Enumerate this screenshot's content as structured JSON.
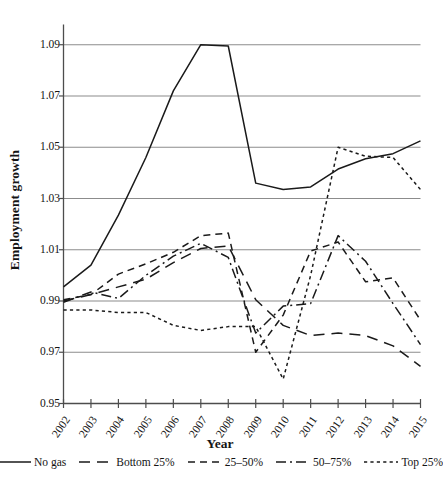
{
  "chart_data": {
    "type": "line",
    "title": "",
    "xlabel": "Year",
    "ylabel": "Employment growth",
    "x": [
      2002,
      2003,
      2004,
      2005,
      2006,
      2007,
      2008,
      2009,
      2010,
      2011,
      2012,
      2013,
      2014,
      2015
    ],
    "xtick_labels": [
      "2002",
      "2003",
      "2004",
      "2005",
      "2006",
      "2007",
      "2008",
      "2009",
      "2010",
      "2011",
      "2012",
      "2013",
      "2014",
      "2015"
    ],
    "xlim": [
      2002,
      2015
    ],
    "ylim": [
      0.95,
      1.0975
    ],
    "ytick_labels": [
      "0.95",
      "0.97",
      "0.99",
      "1.01",
      "1.03",
      "1.05",
      "1.07",
      "1.09"
    ],
    "yticks": [
      0.95,
      0.97,
      0.99,
      1.01,
      1.03,
      1.05,
      1.07,
      1.09
    ],
    "grid": "horizontal",
    "legend_position": "below",
    "line_color": "#1a1a1a",
    "grid_color": "#8c8c8c",
    "axis_color": "#4d4d4d",
    "series": [
      {
        "name": "No gas",
        "style": "solid",
        "dash": "none",
        "values": [
          0.9955,
          1.004,
          1.0235,
          1.046,
          1.072,
          1.09,
          1.0895,
          1.036,
          1.0335,
          1.0345,
          1.0415,
          1.0455,
          1.0475,
          1.0525
        ]
      },
      {
        "name": "Bottom 25%",
        "style": "long-dash",
        "dash": "11 7",
        "values": [
          0.99,
          0.9925,
          0.9955,
          0.9985,
          1.005,
          1.0105,
          1.0115,
          0.9905,
          0.9805,
          0.9765,
          0.9775,
          0.9765,
          0.9725,
          0.9645
        ]
      },
      {
        "name": "25–50%",
        "style": "dash",
        "dash": "7 5",
        "values": [
          0.9905,
          0.9925,
          1.0005,
          1.0045,
          1.009,
          1.0155,
          1.0165,
          0.97,
          0.9845,
          1.0095,
          1.013,
          0.9975,
          0.999,
          0.9825
        ]
      },
      {
        "name": "50–75%",
        "style": "dash-dot",
        "dash": "10 4 2 4",
        "values": [
          0.9895,
          0.9935,
          0.991,
          1.0,
          1.0075,
          1.0125,
          1.007,
          0.9775,
          0.988,
          0.989,
          1.0155,
          1.0055,
          0.989,
          0.973
        ]
      },
      {
        "name": "Top 25%",
        "style": "dotted",
        "dash": "3.2 3.2",
        "values": [
          0.9865,
          0.9865,
          0.9855,
          0.9855,
          0.9805,
          0.9785,
          0.98,
          0.98,
          0.9595,
          1.0,
          1.05,
          1.0465,
          1.046,
          1.0335
        ]
      }
    ]
  },
  "axes": {
    "y_title": "Employment growth",
    "x_title": "Year"
  },
  "legend": {
    "items": [
      {
        "label": "No gas"
      },
      {
        "label": "Bottom 25%"
      },
      {
        "label": "25–50%"
      },
      {
        "label": "50–75%"
      },
      {
        "label": "Top 25%"
      }
    ]
  }
}
